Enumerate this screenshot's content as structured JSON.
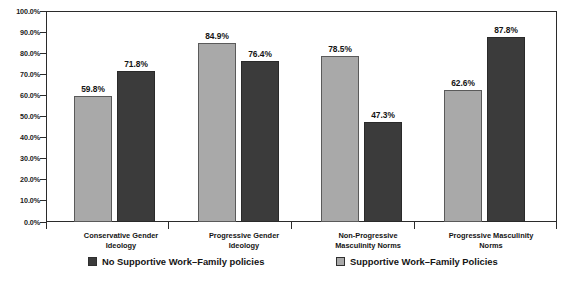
{
  "chart_data": {
    "type": "bar",
    "title": "",
    "xlabel": "",
    "ylabel": "",
    "ylim": [
      0,
      100
    ],
    "grid": false,
    "legend_position": "bottom",
    "categories": [
      "Conservative Gender Ideology",
      "Progressive Gender Ideology",
      "Non-Progressive Masculinity Norms",
      "Progressive Masculinity Norms"
    ],
    "category_lines": [
      [
        "Conservative Gender",
        "Ideology"
      ],
      [
        "Progressive Gender",
        "Ideology"
      ],
      [
        "Non-Progressive",
        "Masculinity Norms"
      ],
      [
        "Progressive Masculinity",
        "Norms"
      ]
    ],
    "series": [
      {
        "name": "Supportive Work–Family Policies",
        "color": "#a9a9a9",
        "values": [
          59.8,
          84.9,
          78.5,
          62.6
        ],
        "labels": [
          "59.8%",
          "84.9%",
          "78.5%",
          "62.6%"
        ]
      },
      {
        "name": "No Supportive Work–Family policies",
        "color": "#3b3b3b",
        "values": [
          71.8,
          76.4,
          47.3,
          87.8
        ],
        "labels": [
          "71.8%",
          "76.4%",
          "47.3%",
          "87.8%"
        ]
      }
    ],
    "y_ticks": [
      "0.0%",
      "10.0%",
      "20.0%",
      "30.0%",
      "40.0%",
      "50.0%",
      "60.0%",
      "70.0%",
      "80.0%",
      "90.0%",
      "100.0%"
    ],
    "y_tick_values": [
      0,
      10,
      20,
      30,
      40,
      50,
      60,
      70,
      80,
      90,
      100
    ]
  },
  "legend": {
    "items": [
      {
        "label": "No Supportive Work–Family policies",
        "swatch": "dark"
      },
      {
        "label": "Supportive Work–Family Policies",
        "swatch": "light"
      }
    ]
  }
}
